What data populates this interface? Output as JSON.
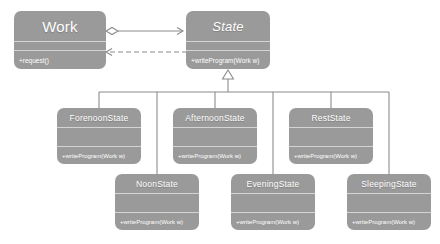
{
  "diagram": {
    "type": "uml-class-diagram",
    "background_color": "#ffffff",
    "class_fill_color": "#9a9a9a",
    "class_text_color": "#ffffff",
    "line_color": "#8c8c8c",
    "separator_color": "#d4d4d4"
  },
  "classes": {
    "work": {
      "name": "Work",
      "stereotype": "",
      "abstract": false,
      "attributes": "",
      "operations": "+request()"
    },
    "state": {
      "name": "State",
      "stereotype": "",
      "abstract": true,
      "attributes": "",
      "operations": "+writeProgram(Work w)"
    },
    "forenoon": {
      "name": "ForenoonState",
      "abstract": false,
      "attributes": "",
      "operations": "+writeProgram(Work w)"
    },
    "afternoon": {
      "name": "AfternoonState",
      "abstract": false,
      "attributes": "",
      "operations": "+writeProgram(Work w)"
    },
    "rest": {
      "name": "RestState",
      "abstract": false,
      "attributes": "",
      "operations": "+writeProgram(Work w)"
    },
    "noon": {
      "name": "NoonState",
      "abstract": false,
      "attributes": "",
      "operations": "+writeProgram(Work w)"
    },
    "evening": {
      "name": "EveningState",
      "abstract": false,
      "attributes": "",
      "operations": "+writeProgram(Work w)"
    },
    "sleeping": {
      "name": "SleepingState",
      "abstract": false,
      "attributes": "",
      "operations": "+writeProgram(Work w)"
    }
  },
  "relationships": [
    {
      "id": "work-aggregates-state",
      "kind": "aggregation",
      "from": "work",
      "to": "state",
      "line_style": "solid",
      "source_decoration": "hollow-diamond",
      "target_decoration": "open-arrow",
      "label": ""
    },
    {
      "id": "state-depends-on-work",
      "kind": "dependency",
      "from": "state",
      "to": "work",
      "line_style": "dashed",
      "source_decoration": "none",
      "target_decoration": "open-arrow",
      "label": ""
    },
    {
      "id": "forenoon-inherits-state",
      "kind": "generalization",
      "from": "forenoon",
      "to": "state",
      "line_style": "solid",
      "target_decoration": "hollow-triangle",
      "label": ""
    },
    {
      "id": "afternoon-inherits-state",
      "kind": "generalization",
      "from": "afternoon",
      "to": "state",
      "line_style": "solid",
      "target_decoration": "hollow-triangle",
      "label": ""
    },
    {
      "id": "rest-inherits-state",
      "kind": "generalization",
      "from": "rest",
      "to": "state",
      "line_style": "solid",
      "target_decoration": "hollow-triangle",
      "label": ""
    },
    {
      "id": "noon-inherits-state",
      "kind": "generalization",
      "from": "noon",
      "to": "state",
      "line_style": "solid",
      "target_decoration": "hollow-triangle",
      "label": ""
    },
    {
      "id": "evening-inherits-state",
      "kind": "generalization",
      "from": "evening",
      "to": "state",
      "line_style": "solid",
      "target_decoration": "hollow-triangle",
      "label": ""
    },
    {
      "id": "sleeping-inherits-state",
      "kind": "generalization",
      "from": "sleeping",
      "to": "state",
      "line_style": "solid",
      "target_decoration": "hollow-triangle",
      "label": ""
    }
  ]
}
